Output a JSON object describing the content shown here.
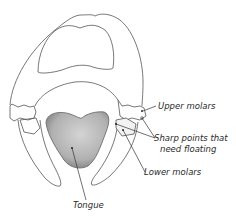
{
  "diagram": {
    "labels": {
      "upper_molars": "Upper molars",
      "sharp_points_line1": "Sharp points that",
      "sharp_points_line2": "need floating",
      "lower_molars": "Lower molars",
      "tongue": "Tongue"
    },
    "colors": {
      "outline": "#555555",
      "tongue_fill": "#b3b3b3",
      "tongue_shade": "#8a8a8a",
      "leader_line": "#333333",
      "background": "#ffffff"
    }
  }
}
